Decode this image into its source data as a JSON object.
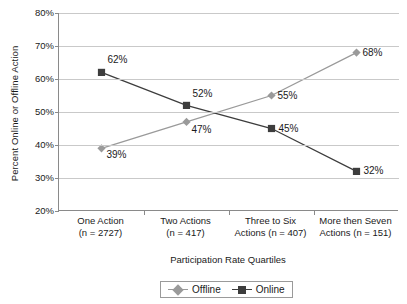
{
  "chart_data": {
    "type": "line",
    "title": "",
    "xlabel": "Participation Rate Quartiles",
    "ylabel": "Percent Online or Offline Action",
    "categories": [
      "One Action (n = 2727)",
      "Two Actions (n = 417)",
      "Three to Six Actions (n = 407)",
      "More then Seven Actions (n = 151)"
    ],
    "category_lines": [
      [
        "One Action",
        "(n = 2727)"
      ],
      [
        "Two Actions",
        "(n = 417)"
      ],
      [
        "Three to Six",
        "Actions (n = 407)"
      ],
      [
        "More then Seven",
        "Actions (n = 151)"
      ]
    ],
    "series": [
      {
        "name": "Offline",
        "color": "#9a9a9a",
        "marker": "diamond",
        "values": [
          39,
          47,
          55,
          68
        ],
        "labels": [
          "39%",
          "47%",
          "55%",
          "68%"
        ]
      },
      {
        "name": "Online",
        "color": "#3d3d3d",
        "marker": "square",
        "values": [
          62,
          52,
          45,
          32
        ],
        "labels": [
          "62%",
          "52%",
          "45%",
          "32%"
        ]
      }
    ],
    "ylim": [
      20,
      80
    ],
    "yticks": [
      20,
      30,
      40,
      50,
      60,
      70,
      80
    ],
    "ytick_labels": [
      "20%",
      "30%",
      "40%",
      "50%",
      "60%",
      "70%",
      "80%"
    ],
    "grid": true,
    "legend_position": "bottom"
  },
  "legend": {
    "entries": [
      {
        "label": "Offline"
      },
      {
        "label": "Online"
      }
    ]
  }
}
